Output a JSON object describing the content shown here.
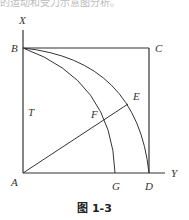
{
  "top_text": "的运动和受力示意图分析。",
  "figure": {
    "caption": "图 1-3",
    "axis_labels": {
      "x_axis": "X",
      "y_axis": "Y"
    },
    "points": [
      "A",
      "B",
      "C",
      "D",
      "E",
      "F",
      "G",
      "T"
    ],
    "labels": {
      "A": "A",
      "B": "B",
      "C": "C",
      "D": "D",
      "E": "E",
      "F": "F",
      "G": "G",
      "T": "T"
    }
  }
}
